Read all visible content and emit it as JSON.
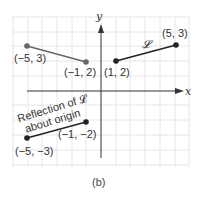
{
  "figure": {
    "caption": "(b)",
    "axes": {
      "x_label": "x",
      "y_label": "y"
    },
    "grid": {
      "x_range": [
        -6,
        6
      ],
      "y_range": [
        -5,
        6
      ],
      "step": 1
    },
    "segments": [
      {
        "name": "L",
        "label": "𝓛",
        "from": [
          1,
          2
        ],
        "to": [
          5,
          3
        ],
        "color": "#222222"
      },
      {
        "name": "reflection-about-y-axis",
        "from": [
          -5,
          3
        ],
        "to": [
          -1,
          2
        ],
        "color": "#666666"
      },
      {
        "name": "reflection-about-origin",
        "from": [
          -5,
          -3
        ],
        "to": [
          -1,
          -2
        ],
        "color": "#222222"
      }
    ],
    "point_labels": {
      "p1": "(−5, 3)",
      "p2": "(−1, 2)",
      "p3": "(1, 2)",
      "p4": "(5, 3)",
      "p5": "(−5, −3)",
      "p6": "(−1, −2)"
    },
    "annotation": {
      "line1": "Reflection of 𝓛",
      "line2": "about origin"
    },
    "curve_label": "𝓛"
  }
}
